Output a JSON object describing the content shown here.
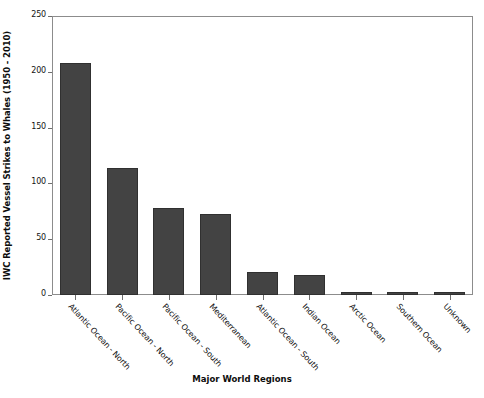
{
  "chart_data": {
    "type": "bar",
    "title": "",
    "xlabel": "Major World Regions",
    "ylabel": "IWC Reported Vessel Strikes to Whales (1950 - 2010)",
    "categories": [
      "Atlantic Ocean - North",
      "Pacific Ocean - North",
      "Pacific Ocean - South",
      "Mediterranean",
      "Atlantic Ocean - South",
      "Indian Ocean",
      "Arctic Ocean",
      "Southern Ocean",
      "Unknown"
    ],
    "values": [
      208,
      114,
      78,
      73,
      21,
      18,
      3,
      3,
      3
    ],
    "ylim": [
      0,
      250
    ],
    "yticks": [
      0,
      50,
      100,
      150,
      200,
      250
    ],
    "ytick_labels": [
      "0",
      "50",
      "100",
      "150",
      "200",
      "250"
    ],
    "grid": false,
    "legend": null,
    "bar_color": "#434343",
    "bar_edge_color": "#303030",
    "frame_color": "#8c8c8c",
    "background_color": "#ffffff"
  }
}
